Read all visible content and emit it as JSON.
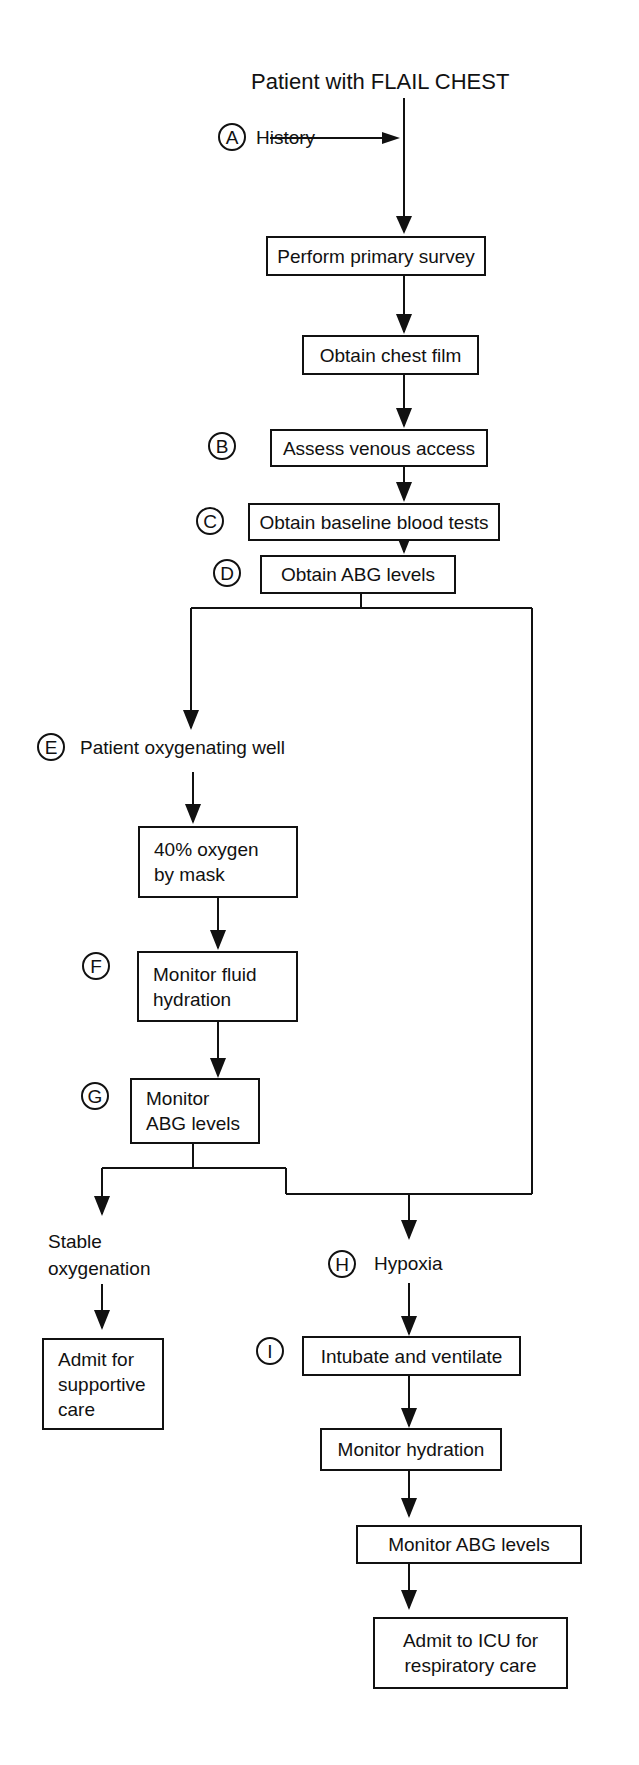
{
  "diagram": {
    "type": "clinical-flowchart",
    "title": "Patient with FLAIL CHEST",
    "markers": {
      "A": "A",
      "B": "B",
      "C": "C",
      "D": "D",
      "E": "E",
      "F": "F",
      "G": "G",
      "H": "H",
      "I": "I"
    },
    "labels": {
      "history": "History",
      "patient_oxygenating_well": "Patient oxygenating well",
      "stable_oxygenation": "Stable\noxygenation",
      "hypoxia": "Hypoxia"
    },
    "nodes": {
      "primary_survey": "Perform primary survey",
      "chest_film": "Obtain chest film",
      "venous_access": "Assess venous access",
      "baseline_blood": "Obtain baseline blood tests",
      "abg_levels": "Obtain ABG levels",
      "oxygen_mask": "40% oxygen\nby mask",
      "fluid_hydration": "Monitor fluid\nhydration",
      "monitor_abg_left": "Monitor\nABG levels",
      "admit_supportive": "Admit for\nsupportive\ncare",
      "intubate": "Intubate and ventilate",
      "monitor_hydration": "Monitor hydration",
      "monitor_abg_right": "Monitor ABG levels",
      "admit_icu": "Admit to ICU for\nrespiratory care"
    },
    "edges": [
      [
        "title",
        "primary_survey"
      ],
      [
        "history",
        "title->primary_survey"
      ],
      [
        "primary_survey",
        "chest_film"
      ],
      [
        "chest_film",
        "venous_access"
      ],
      [
        "venous_access",
        "baseline_blood"
      ],
      [
        "baseline_blood",
        "abg_levels"
      ],
      [
        "abg_levels",
        "patient_oxygenating_well"
      ],
      [
        "abg_levels",
        "hypoxia"
      ],
      [
        "patient_oxygenating_well",
        "oxygen_mask"
      ],
      [
        "oxygen_mask",
        "fluid_hydration"
      ],
      [
        "fluid_hydration",
        "monitor_abg_left"
      ],
      [
        "monitor_abg_left",
        "stable_oxygenation"
      ],
      [
        "monitor_abg_left",
        "hypoxia"
      ],
      [
        "stable_oxygenation",
        "admit_supportive"
      ],
      [
        "hypoxia",
        "intubate"
      ],
      [
        "intubate",
        "monitor_hydration"
      ],
      [
        "monitor_hydration",
        "monitor_abg_right"
      ],
      [
        "monitor_abg_right",
        "admit_icu"
      ]
    ]
  }
}
